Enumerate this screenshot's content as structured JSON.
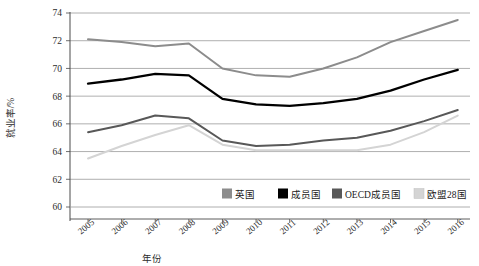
{
  "chart_data": {
    "type": "line",
    "title": "",
    "xlabel": "年份",
    "ylabel": "就业率/%",
    "ylim": [
      60,
      74
    ],
    "ytick_step": 2,
    "yticks": [
      "60",
      "62",
      "64",
      "66",
      "68",
      "70",
      "72",
      "74"
    ],
    "grid": true,
    "legend_position": "bottom",
    "categories": [
      "2005",
      "2006",
      "2007",
      "2008",
      "2009",
      "2010",
      "2011",
      "2012",
      "2013",
      "2014",
      "2015",
      "2016"
    ],
    "series": [
      {
        "name": "英国",
        "color": "#8c8c8c",
        "values": [
          72.1,
          71.9,
          71.6,
          71.8,
          70.0,
          69.5,
          69.4,
          70.0,
          70.8,
          71.9,
          72.7,
          73.5
        ]
      },
      {
        "name": "成员国",
        "color": "#000000",
        "values": [
          68.9,
          69.2,
          69.6,
          69.5,
          67.8,
          67.4,
          67.3,
          67.5,
          67.8,
          68.4,
          69.2,
          69.9
        ]
      },
      {
        "name": "OECD成员国",
        "color": "#585858",
        "values": [
          65.4,
          65.9,
          66.6,
          66.4,
          64.8,
          64.4,
          64.5,
          64.8,
          65.0,
          65.5,
          66.2,
          67.0
        ]
      },
      {
        "name": "欧盟28国",
        "color": "#d4d4d4",
        "values": [
          63.5,
          64.4,
          65.2,
          65.9,
          64.5,
          64.1,
          64.1,
          64.1,
          64.1,
          64.5,
          65.4,
          66.6
        ]
      }
    ]
  },
  "legend": {
    "items": [
      {
        "label": "英国",
        "color": "#8c8c8c"
      },
      {
        "label": "成员国",
        "color": "#000000"
      },
      {
        "label": "OECD成员国",
        "color": "#585858"
      },
      {
        "label": "欧盟28国",
        "color": "#d4d4d4"
      }
    ]
  },
  "axes": {
    "y_label": "就业率/%",
    "x_label": "年份"
  }
}
